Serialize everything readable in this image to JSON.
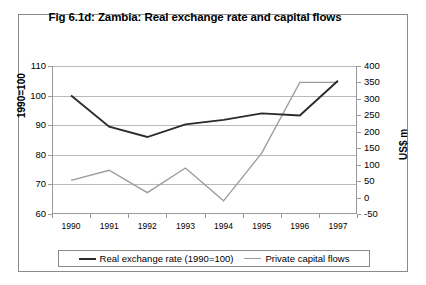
{
  "figure": {
    "title": "Fig 6.1d: Zambia: Real exchange rate and capital flows"
  },
  "axes": {
    "y_left_label": "1990=100",
    "y_right_label": "US$ m",
    "y_left_ticks": [
      "110",
      "100",
      "90",
      "80",
      "70",
      "60"
    ],
    "y_right_ticks": [
      "400",
      "350",
      "300",
      "250",
      "200",
      "150",
      "100",
      "50",
      "0",
      "-50"
    ],
    "x_ticks": [
      "1990",
      "1991",
      "1992",
      "1993",
      "1994",
      "1995",
      "1996",
      "1997"
    ]
  },
  "legend": {
    "entries": [
      {
        "label": "Real exchange rate (1990=100)",
        "color": "#2b2b2b"
      },
      {
        "label": "Private capital flows",
        "color": "#9a9a9a"
      }
    ]
  },
  "colors": {
    "series_dark": "#2b2b2b",
    "series_grey": "#9a9a9a",
    "gridline": "#b9b9b9",
    "frame": "#8a8a8a",
    "axis": "#9a9a9a",
    "text": "#000000",
    "background": "#ffffff"
  },
  "chart_data": {
    "type": "line",
    "title": "Fig 6.1d: Zambia: Real exchange rate and capital flows",
    "xlabel": "",
    "x": [
      1990,
      1991,
      1992,
      1993,
      1994,
      1995,
      1996,
      1997
    ],
    "categories": [
      "1990",
      "1991",
      "1992",
      "1993",
      "1994",
      "1995",
      "1996",
      "1997"
    ],
    "grid": true,
    "legend_position": "bottom",
    "series": [
      {
        "name": "Real exchange rate (1990=100)",
        "axis": "left",
        "ylabel": "1990=100",
        "ylim": [
          60,
          110
        ],
        "ytick_step": 10,
        "color": "#2b2b2b",
        "values": [
          100,
          89.5,
          86,
          90.3,
          91.8,
          94,
          93.3,
          105
        ]
      },
      {
        "name": "Private capital flows",
        "axis": "right",
        "ylabel": "US$ m",
        "ylim": [
          -50,
          400
        ],
        "ytick_step": 50,
        "color": "#9a9a9a",
        "values": [
          52,
          83,
          15,
          90,
          -10,
          135,
          350,
          350
        ]
      }
    ]
  }
}
